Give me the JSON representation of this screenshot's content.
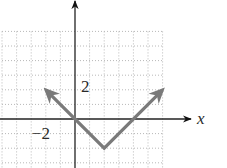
{
  "chart_data": {
    "type": "line",
    "title": "",
    "function": "y = |x - 2| - 2",
    "xlabel": "x",
    "ylabel": "",
    "xlim": [
      -5,
      6
    ],
    "ylim": [
      -3.3,
      6
    ],
    "grid": true,
    "grid_step": 1,
    "tick_labels": [
      {
        "axis": "y",
        "value": 2,
        "text": "2"
      },
      {
        "axis": "x",
        "value": -2,
        "text": "−2"
      }
    ],
    "series": [
      {
        "name": "y = |x - 2| - 2",
        "x": [
          -2,
          2,
          6
        ],
        "y": [
          2,
          -2,
          2
        ],
        "arrows_at_ends": true,
        "color": "#7a7a7a"
      }
    ],
    "key_points": {
      "vertex": [
        2,
        -2
      ],
      "x_intercepts": [
        0,
        4
      ],
      "y_intercept": 0
    }
  },
  "labels": {
    "x_axis": "x",
    "y_tick_2": "2",
    "x_tick_neg2": "−2"
  },
  "layout": {
    "origin_px": [
      75,
      119
    ],
    "unit_px": 14.6
  }
}
